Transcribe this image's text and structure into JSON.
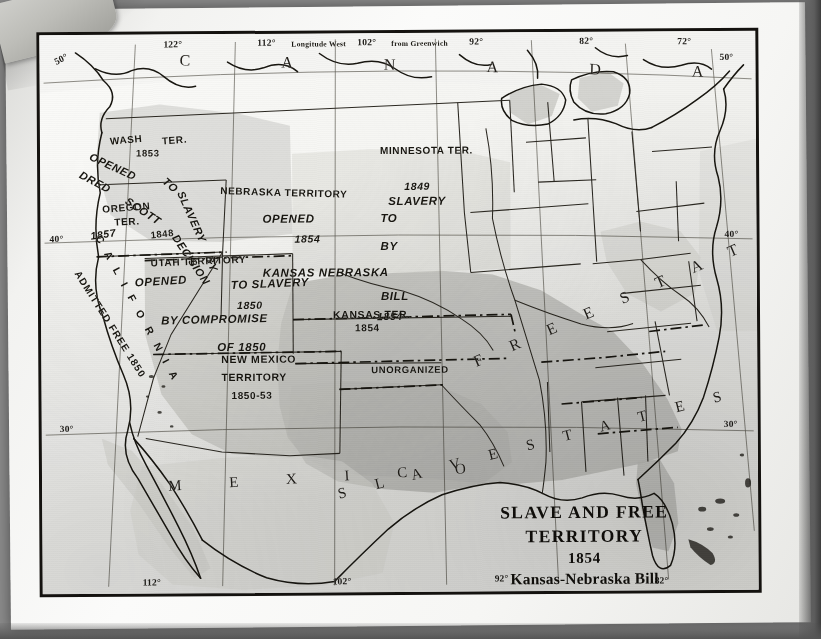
{
  "map": {
    "title_lines": {
      "line1": "SLAVE AND FREE",
      "line2": "TERRITORY",
      "line3": "1854",
      "line4": "Kansas-Nebraska Bill"
    },
    "graticule": {
      "top_labels": [
        {
          "text": "122°"
        },
        {
          "text": "112°"
        },
        {
          "text": "Longitude  West"
        },
        {
          "text": "102°"
        },
        {
          "text": "from  Greenwich"
        },
        {
          "text": "92°"
        },
        {
          "text": "82°"
        },
        {
          "text": "72°"
        }
      ],
      "bottom_labels": [
        {
          "text": "112°"
        },
        {
          "text": "102°"
        },
        {
          "text": "92°"
        },
        {
          "text": "82°"
        }
      ],
      "left_labels": [
        {
          "text": "50°"
        },
        {
          "text": "40°"
        },
        {
          "text": "30°"
        }
      ],
      "right_labels": [
        {
          "text": "50°"
        },
        {
          "text": "40°"
        },
        {
          "text": "30°"
        }
      ]
    },
    "countries": {
      "canada": "C A N A D A",
      "mexico": "M E X I C O"
    },
    "regions": {
      "free_states": "F R E E   S T A T E S",
      "slave_states": "S L A V E   S T A T E S"
    },
    "territories": [
      {
        "id": "washington",
        "name": "WASH",
        "name2": "TER.",
        "year": "1853"
      },
      {
        "id": "oregon",
        "name": "OREGON",
        "name2": "TER.",
        "year": "1848"
      },
      {
        "id": "dred-scott",
        "l1": "OPENED",
        "l2": "TO",
        "l3": "SLAVERY",
        "l4": "BY",
        "l5": "DRED",
        "l6": "SCOTT",
        "l7": "DECISION",
        "year": "1857"
      },
      {
        "id": "nebraska",
        "name": "NEBRASKA  TERRITORY",
        "l1": "OPENED",
        "l2": "TO",
        "l3": "BY",
        "year": "1854",
        "l4": "KANSAS  NEBRASKA",
        "l5": "BILL",
        "year2": "1854"
      },
      {
        "id": "minnesota",
        "name": "MINNESOTA  TER.",
        "year": "1849",
        "note": "SLAVERY"
      },
      {
        "id": "utah",
        "name": "UTAH  TERRITORY",
        "l1": "OPENED",
        "l2": "TO  SLAVERY",
        "year": "1850",
        "l3": "BY  COMPROMISE",
        "l4": "OF  1850"
      },
      {
        "id": "kansas",
        "name": "KANSAS  TER.",
        "year": "1854"
      },
      {
        "id": "unorganized",
        "name": "UNORGANIZED"
      },
      {
        "id": "new-mexico",
        "name": "NEW  MEXICO",
        "name2": "TERRITORY",
        "year": "1850-53"
      },
      {
        "id": "california",
        "name": "C A L I F O R N I A",
        "note": "ADMITTED  FREE  1850"
      }
    ],
    "colors": {
      "paper": "#f7f7f5",
      "ink": "#17150f",
      "slave_shading": "#bcbcb7",
      "free_shading": "#f2f2ef",
      "territory_shading": "#cfcfca",
      "border": "#14120f"
    }
  }
}
